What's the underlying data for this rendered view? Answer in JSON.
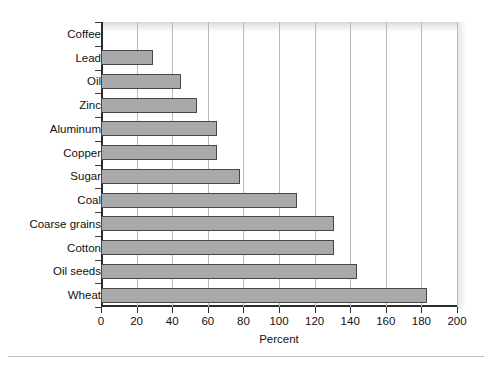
{
  "chart_data": {
    "type": "bar",
    "orientation": "horizontal",
    "title": "",
    "xlabel": "Percent",
    "ylabel": "",
    "xlim": [
      0,
      200
    ],
    "xticks": [
      0,
      20,
      40,
      60,
      80,
      100,
      120,
      140,
      160,
      180,
      200
    ],
    "grid": "vertical",
    "legend": "none",
    "categories": [
      "Coffee",
      "Lead",
      "Oil",
      "Zinc",
      "Aluminum",
      "Copper",
      "Sugar",
      "Coal",
      "Coarse grains",
      "Cotton",
      "Oil seeds",
      "Wheat"
    ],
    "values": [
      0,
      29,
      45,
      54,
      65,
      65,
      78,
      110,
      131,
      131,
      144,
      183
    ],
    "bar_color": "#a9a9a9",
    "bar_edge_color": "#474747",
    "axis_color": "#2b2b2b",
    "gridline_color": "#b9b9b9"
  }
}
